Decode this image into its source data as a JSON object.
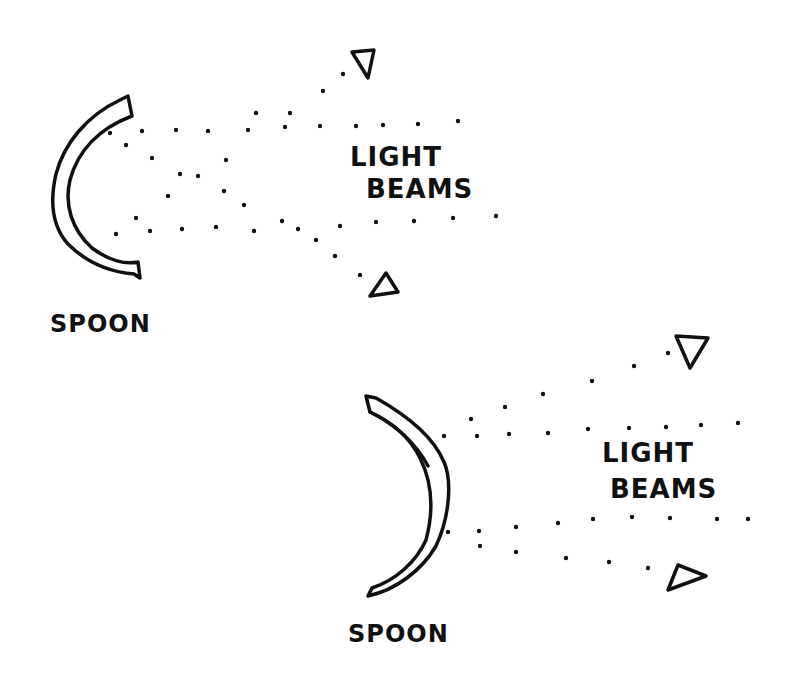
{
  "diagram": {
    "background": "#ffffff",
    "ink_color": "#111111",
    "panels": [
      {
        "id": "top",
        "beams_label_line1": "LIGHT",
        "beams_label_line2": "BEAMS",
        "spoon_label": "SPOON",
        "spoon_orientation": "concave-right"
      },
      {
        "id": "bottom",
        "beams_label_line1": "LIGHT",
        "beams_label_line2": "BEAMS",
        "spoon_label": "SPOON",
        "spoon_orientation": "convex-right"
      }
    ],
    "icons": {
      "beam_marker": "triangle-icon",
      "beam_dots": "dotted-line"
    }
  }
}
